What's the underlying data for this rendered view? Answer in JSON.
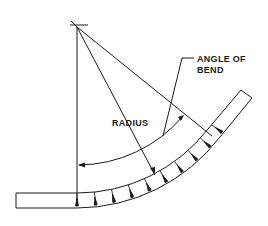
{
  "diagram": {
    "labels": {
      "angle_line1": "ANGLE OF",
      "angle_line2": "BEND",
      "radius": "RADIUS"
    },
    "colors": {
      "line": "#1a1a1a",
      "background": "#ffffff"
    },
    "notch_count": 10
  }
}
